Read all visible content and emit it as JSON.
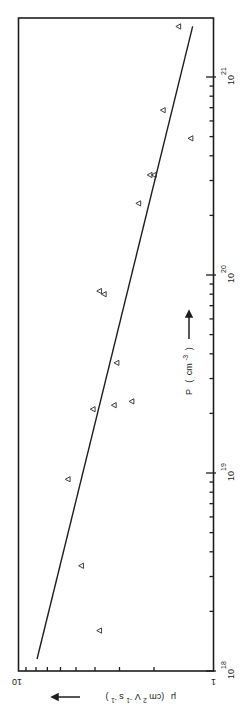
{
  "chart_data": {
    "type": "scatter",
    "orientation": "rotated 90deg clockwise (x-axis p runs vertically on right edge, y-axis mu runs horizontally along bottom edge)",
    "title": "",
    "xlabel": "p (cm-3)",
    "ylabel": "μ (cm2V-1s-1)",
    "x_scale": "log",
    "y_scale": "log",
    "xlim": [
      1e+18,
      2.2e+21
    ],
    "ylim": [
      1,
      10
    ],
    "x_ticks": [
      {
        "value": 1e+18,
        "base": "10",
        "exp": "18"
      },
      {
        "value": 1e+19,
        "base": "10",
        "exp": "19"
      },
      {
        "value": 1e+20,
        "base": "10",
        "exp": "20"
      },
      {
        "value": 1e+21,
        "base": "10",
        "exp": "21"
      }
    ],
    "y_ticks": [
      {
        "value": 1,
        "label": "1"
      },
      {
        "value": 10,
        "label": "10"
      }
    ],
    "grid": false,
    "legend": null,
    "marker": "open-triangle",
    "series": [
      {
        "name": "measured",
        "points": [
          {
            "p": 1.6e+18,
            "mu": 3.8
          },
          {
            "p": 3.4e+18,
            "mu": 4.7
          },
          {
            "p": 9.3e+18,
            "mu": 5.5
          },
          {
            "p": 2.1e+19,
            "mu": 4.1
          },
          {
            "p": 2.2e+19,
            "mu": 3.2
          },
          {
            "p": 2.3e+19,
            "mu": 2.6
          },
          {
            "p": 3.6e+19,
            "mu": 3.1
          },
          {
            "p": 8.3e+19,
            "mu": 3.8
          },
          {
            "p": 8e+19,
            "mu": 3.6
          },
          {
            "p": 2.3e+20,
            "mu": 2.4
          },
          {
            "p": 3.2e+20,
            "mu": 2.1
          },
          {
            "p": 3.2e+20,
            "mu": 2.0
          },
          {
            "p": 4.9e+20,
            "mu": 1.3
          },
          {
            "p": 6.8e+20,
            "mu": 1.8
          },
          {
            "p": 1.8e+21,
            "mu": 1.5
          }
        ]
      },
      {
        "name": "fit",
        "type": "line",
        "points": [
          {
            "p": 1.15e+18,
            "mu": 7.9
          },
          {
            "p": 1.8e+21,
            "mu": 1.27
          }
        ]
      }
    ]
  },
  "axis_labels": {
    "x_label_main": "P",
    "x_label_unit_open": "(",
    "x_label_unit": "cm",
    "x_label_exp": "-3",
    "x_label_unit_close": ")",
    "y_label_main": "μ",
    "y_label_unit": "(cm",
    "y_label_sup1": "2",
    "y_label_mid": "V",
    "y_label_sup2": "-1",
    "y_label_mid2": "s",
    "y_label_sup3": "-1",
    "y_label_close": ")"
  }
}
